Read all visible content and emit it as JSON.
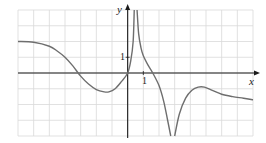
{
  "chart_data": {
    "type": "line",
    "title": "",
    "xlabel": "x",
    "ylabel": "y",
    "xlim": [
      -7,
      8
    ],
    "ylim": [
      -4,
      4
    ],
    "grid": true,
    "legend": null,
    "tick_labels": {
      "x": [
        "1"
      ],
      "y": [
        "1"
      ]
    },
    "annotations": [
      "vertical asymptote (spike to +inf) near x = 0.45",
      "vertical asymptote (to -inf) near x = 2.9"
    ],
    "series": [
      {
        "name": "f(x)",
        "segments": [
          {
            "x": [
              -7,
              -6,
              -5,
              -4.5,
              -4,
              -3.5,
              -3,
              -2.5,
              -2,
              -1.5,
              -1.2,
              -0.8,
              -0.4,
              0,
              0.2,
              0.35,
              0.42
            ],
            "y": [
              2.0,
              1.95,
              1.7,
              1.4,
              1.0,
              0.45,
              -0.2,
              -0.7,
              -1.05,
              -1.2,
              -1.2,
              -1.0,
              -0.55,
              0,
              0.8,
              2.0,
              4.0
            ]
          },
          {
            "x": [
              0.6,
              0.7,
              0.85,
              1.0,
              1.3,
              1.6,
              2.0,
              2.3,
              2.55,
              2.75
            ],
            "y": [
              4.0,
              2.5,
              1.6,
              1.1,
              0.5,
              0.0,
              -0.8,
              -1.8,
              -3.0,
              -4.0
            ]
          },
          {
            "x": [
              3.0,
              3.3,
              3.7,
              4.1,
              4.5,
              4.9,
              5.4,
              6.0,
              6.7,
              7.4,
              8.0
            ],
            "y": [
              -4.0,
              -2.6,
              -1.6,
              -1.1,
              -0.9,
              -0.9,
              -1.1,
              -1.35,
              -1.5,
              -1.6,
              -1.7
            ]
          }
        ]
      }
    ]
  },
  "labels": {
    "x_axis": "x",
    "y_axis": "y",
    "x_tick_1": "1",
    "y_tick_1": "1"
  },
  "colors": {
    "grid": "#d9d9d9",
    "axis": "#1a1a1a",
    "curve": "#6e6e6e",
    "background": "#ffffff"
  }
}
